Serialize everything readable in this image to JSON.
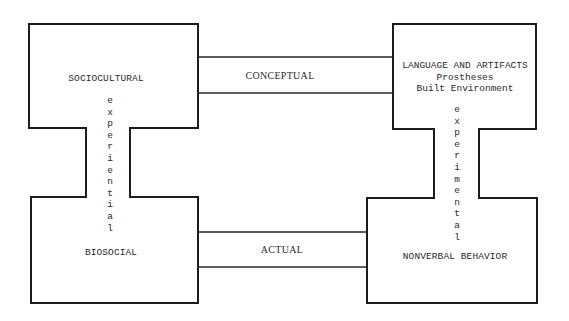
{
  "nodes": {
    "top_left": {
      "label": "SOCIOCULTURAL"
    },
    "bottom_left": {
      "label": "BIOSOCIAL"
    },
    "top_right": {
      "label": "LANGUAGE AND ARTIFACTS",
      "sublabels": [
        "Prostheses",
        "Built Environment"
      ]
    },
    "bottom_right": {
      "label": "NONVERBAL BEHAVIOR"
    }
  },
  "links": {
    "left_vertical": "experiential",
    "right_vertical": "experimental",
    "top_horizontal": "CONCEPTUAL",
    "bottom_horizontal": "ACTUAL"
  },
  "colors": {
    "ink": "#1c1c1c",
    "paper": "#ffffff"
  }
}
